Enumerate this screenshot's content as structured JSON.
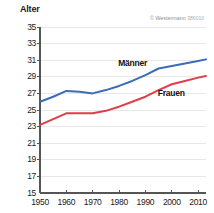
{
  "chart_data": {
    "type": "line",
    "title": "",
    "subtitle": "",
    "xlabel": "",
    "ylabel": "Alter",
    "xlim": [
      1950,
      2013
    ],
    "ylim": [
      15,
      35
    ],
    "ytick_step": 2,
    "yticks": [
      15,
      17,
      19,
      21,
      23,
      25,
      27,
      29,
      31,
      33,
      35
    ],
    "xticks": [
      1950,
      1960,
      1970,
      1980,
      1990,
      2000,
      2010
    ],
    "grid": "horizontal",
    "legend_position": "inline-labels",
    "x": [
      1950,
      1955,
      1960,
      1965,
      1970,
      1975,
      1980,
      1985,
      1990,
      1995,
      2000,
      2005,
      2010,
      2013
    ],
    "series": [
      {
        "name": "Männer",
        "color": "#3b6cb5",
        "values": [
          26.0,
          26.6,
          27.3,
          27.2,
          27.0,
          27.4,
          27.9,
          28.5,
          29.2,
          30.0,
          30.3,
          30.6,
          30.9,
          31.1
        ]
      },
      {
        "name": "Frauen",
        "color": "#e23b4a",
        "values": [
          23.2,
          23.9,
          24.6,
          24.6,
          24.6,
          24.9,
          25.4,
          26.0,
          26.6,
          27.4,
          28.1,
          28.5,
          28.9,
          29.1
        ]
      }
    ],
    "annotations": [
      {
        "text": "Männer",
        "x": 1988,
        "y": 30.6
      },
      {
        "text": "Frauen",
        "x": 2003,
        "y": 26.9
      }
    ]
  },
  "axis": {
    "y_title": "Alter",
    "y_labels": [
      "35",
      "33",
      "31",
      "29",
      "27",
      "25",
      "23",
      "21",
      "19",
      "17",
      "15"
    ],
    "x_labels": [
      "1950",
      "1960",
      "1970",
      "1980",
      "1990",
      "2000",
      "2010"
    ]
  },
  "credit": {
    "symbol": "©",
    "publisher": "Westermann",
    "code": "386010"
  },
  "colors": {
    "maenner": "#3b6cb5",
    "frauen": "#e23b4a",
    "axis": "#555555",
    "grid": "#e2e2e2",
    "text": "#1a1a1a",
    "credit": "#8d8d8d",
    "background": "#ffffff"
  }
}
